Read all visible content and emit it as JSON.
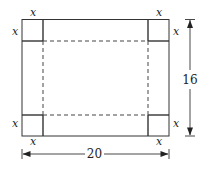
{
  "diagram": {
    "corner_cut_label": "x",
    "width_label": "20",
    "height_label": "16",
    "labels": {
      "top_left_top": "x",
      "top_left_side": "x",
      "top_right_top": "x",
      "top_right_side": "x",
      "bottom_left_side": "x",
      "bottom_left_bottom": "x",
      "bottom_right_side": "x",
      "bottom_right_bottom": "x"
    }
  }
}
